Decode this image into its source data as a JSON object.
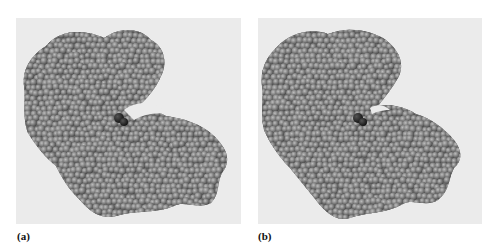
{
  "figure": {
    "type": "space-filling protein structure comparison",
    "panels": [
      {
        "label": "(a)",
        "description": "Protein space-filling model, cleft open with dark ligand visible at hinge",
        "background_color": "#ebebeb",
        "atom_color": "#7d7d7d",
        "ligand_color": "#2b2b2b"
      },
      {
        "label": "(b)",
        "description": "Protein space-filling model, cleft closed around dark ligand",
        "background_color": "#ebebeb",
        "atom_color": "#7d7d7d",
        "ligand_color": "#2b2b2b"
      }
    ]
  },
  "colors": {
    "page_background": "#ffffff",
    "panel_background": "#ebebeb",
    "atom": "#7d7d7d",
    "atom_highlight": "#b4b4b4",
    "atom_shadow": "#4a4a4a",
    "ligand": "#2b2b2b"
  }
}
